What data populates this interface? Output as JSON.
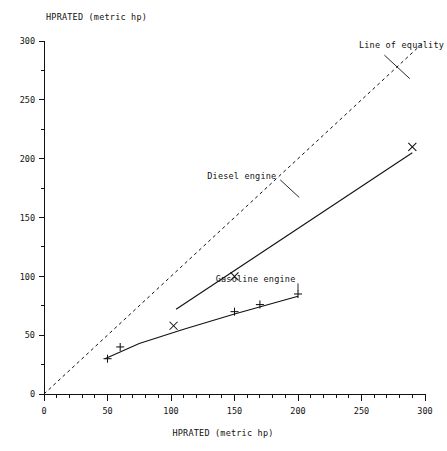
{
  "chart_data": {
    "type": "scatter",
    "title": "",
    "xlabel": "HPRATED (metric hp)",
    "ylabel": "HPRATED (metric hp)",
    "xlim": [
      0,
      300
    ],
    "ylim": [
      0,
      300
    ],
    "xticks": [
      0,
      50,
      100,
      150,
      200,
      250,
      300
    ],
    "yticks": [
      0,
      50,
      100,
      150,
      200,
      250,
      300
    ],
    "xtick_labels": [
      "0",
      "50",
      "100",
      "150",
      "200",
      "250",
      "300"
    ],
    "ytick_labels": [
      "0",
      "50",
      "100",
      "150",
      "200",
      "250",
      "300"
    ],
    "minor_tick_interval": 10,
    "y_minor_tick_interval": 25,
    "grid": false,
    "legend_position": "inline-annotations",
    "series": [
      {
        "name": "Line of equality",
        "style": "dashed",
        "marker": "none",
        "x": [
          0,
          300
        ],
        "y": [
          0,
          300
        ],
        "label": "Line of equality",
        "label_x": 248,
        "label_y": 297
      },
      {
        "name": "Diesel engine",
        "style": "solid",
        "marker": "x",
        "x": [
          102,
          150,
          290
        ],
        "y": [
          58,
          100,
          210
        ],
        "fit_x": [
          104,
          290
        ],
        "fit_y": [
          72,
          205
        ],
        "label": "Diesel engine",
        "label_x": 183,
        "label_y": 185
      },
      {
        "name": "Gasoline engine",
        "style": "solid",
        "marker": "plus",
        "x": [
          50,
          60,
          150,
          170,
          200
        ],
        "y": [
          30,
          40,
          70,
          76,
          85
        ],
        "fit_x": [
          48,
          75,
          110,
          150,
          200
        ],
        "fit_y": [
          30,
          43,
          55,
          68,
          83
        ],
        "label": "Gasoline engine",
        "label_x": 198,
        "label_y": 98
      }
    ]
  }
}
